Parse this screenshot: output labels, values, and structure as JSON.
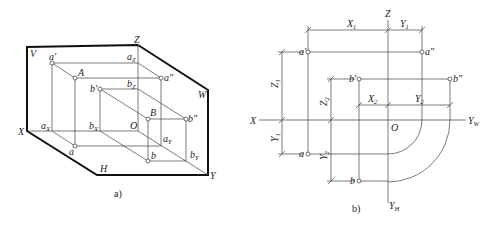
{
  "figure_a": {
    "caption": "a)",
    "axes": {
      "x": "X",
      "y": "Y",
      "z": "Z",
      "origin": "O"
    },
    "planes": {
      "v": "V",
      "h": "H",
      "w": "W"
    },
    "points": {
      "a_prime": "a'",
      "a_upper": "A",
      "a_double_prime": "a\"",
      "a_lower": "a",
      "a_x": "a",
      "a_x_sub": "X",
      "a_z": "a",
      "a_z_sub": "Z",
      "a_y": "a",
      "a_y_sub": "Y",
      "b_prime": "b'",
      "b_upper": "B",
      "b_double_prime": "b\"",
      "b_lower": "b",
      "b_x": "b",
      "b_x_sub": "X",
      "b_z": "b",
      "b_z_sub": "Z",
      "b_y": "b",
      "b_y_sub": "Y"
    }
  },
  "figure_b": {
    "caption": "b)",
    "axes": {
      "x": "X",
      "z": "Z",
      "origin": "O",
      "yw": "Y",
      "yw_sub": "W",
      "yh": "Y",
      "yh_sub": "H"
    },
    "points": {
      "a_prime": "a'",
      "a_double_prime": "a\"",
      "a_lower": "a",
      "b_prime": "b'",
      "b_double_prime": "b\"",
      "b_lower": "b"
    },
    "dimensions": {
      "x1": "X",
      "x1_sub": "1",
      "y1_top": "Y",
      "y1_top_sub": "1",
      "x2": "X",
      "x2_sub": "2",
      "y2_top": "Y",
      "y2_top_sub": "2",
      "z1": "Z",
      "z1_sub": "1",
      "y1_left": "Y",
      "y1_left_sub": "1",
      "z2": "Z",
      "z2_sub": "2",
      "y2_left": "Y",
      "y2_left_sub": "2"
    }
  }
}
